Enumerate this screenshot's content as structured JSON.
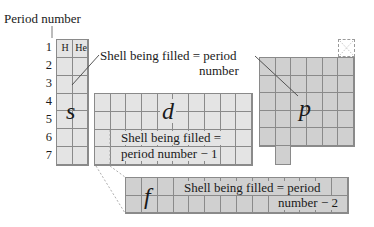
{
  "header": {
    "label": "Period number"
  },
  "periods": [
    "1",
    "2",
    "3",
    "4",
    "5",
    "6",
    "7"
  ],
  "blocks": {
    "s": {
      "letter": "s",
      "elements": [
        "H",
        "He"
      ],
      "columns": 2,
      "rows": 7
    },
    "d": {
      "letter": "d",
      "columns": 10,
      "rows": 4,
      "annotation_line1": "Shell being filled =",
      "annotation_line2": "period number − 1"
    },
    "p": {
      "letter": "p",
      "columns": 6,
      "rows": 5
    },
    "f": {
      "letter": "f",
      "columns": 14,
      "rows": 2,
      "annotation_line1": "Shell being filled = period",
      "annotation_line2": "number − 2"
    }
  },
  "callout": {
    "line1": "Shell being filled = period",
    "line2": "number"
  },
  "colors": {
    "light_block": "#e4e4e4",
    "dark_block": "#d0d0d0",
    "grid_line": "#8a8a8a",
    "text": "#1a1a1a"
  }
}
